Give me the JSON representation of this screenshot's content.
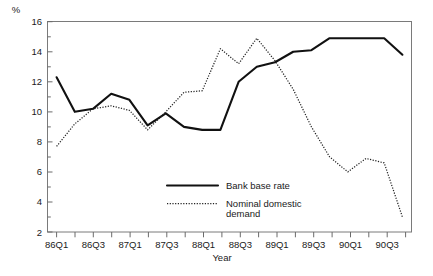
{
  "chart_data": {
    "type": "line",
    "title": "",
    "xlabel": "Year",
    "ylabel": "%",
    "ylim": [
      2,
      16
    ],
    "yticks": [
      2,
      4,
      6,
      8,
      10,
      12,
      14,
      16
    ],
    "yticks_minor": [
      3,
      5,
      7,
      9,
      11,
      13,
      15
    ],
    "grid": false,
    "legend_position": "inside-lower-center",
    "x": [
      "86Q1",
      "86Q2",
      "86Q3",
      "86Q4",
      "87Q1",
      "87Q2",
      "87Q3",
      "87Q4",
      "88Q1",
      "88Q2",
      "88Q3",
      "88Q4",
      "89Q1",
      "89Q2",
      "89Q3",
      "89Q4",
      "90Q1",
      "90Q2",
      "90Q3",
      "90Q4"
    ],
    "xtick_labels": [
      "86Q1",
      "86Q3",
      "87Q1",
      "87Q3",
      "88Q1",
      "88Q3",
      "89Q1",
      "89Q3",
      "90Q1",
      "90Q3"
    ],
    "series": [
      {
        "name": "Bank base rate",
        "style": "solid",
        "color": "#111111",
        "values": [
          12.3,
          10.0,
          10.2,
          11.2,
          10.8,
          9.1,
          9.9,
          9.0,
          8.8,
          8.8,
          12.0,
          13.0,
          13.3,
          14.0,
          14.1,
          14.9,
          14.9,
          14.9,
          14.9,
          13.8
        ]
      },
      {
        "name": "Nominal domestic demand",
        "style": "dotted",
        "color": "#222222",
        "values": [
          7.7,
          9.2,
          10.2,
          10.4,
          10.1,
          8.8,
          10.0,
          11.3,
          11.4,
          14.2,
          13.2,
          14.9,
          13.4,
          11.5,
          9.0,
          7.0,
          6.0,
          6.9,
          6.6,
          3.0
        ]
      }
    ]
  },
  "legend": {
    "items": [
      {
        "label": "Bank base rate",
        "style": "solid"
      },
      {
        "label": "Nominal domestic",
        "label2": "demand",
        "style": "dotted"
      }
    ]
  },
  "axes": {
    "unit_label": "%",
    "x_axis_title": "Year"
  },
  "colors": {
    "frame": "#7a7a7a",
    "solid_series": "#111111",
    "dotted_series": "#222222",
    "background": "#ffffff"
  },
  "caption": {
    "text": ""
  }
}
